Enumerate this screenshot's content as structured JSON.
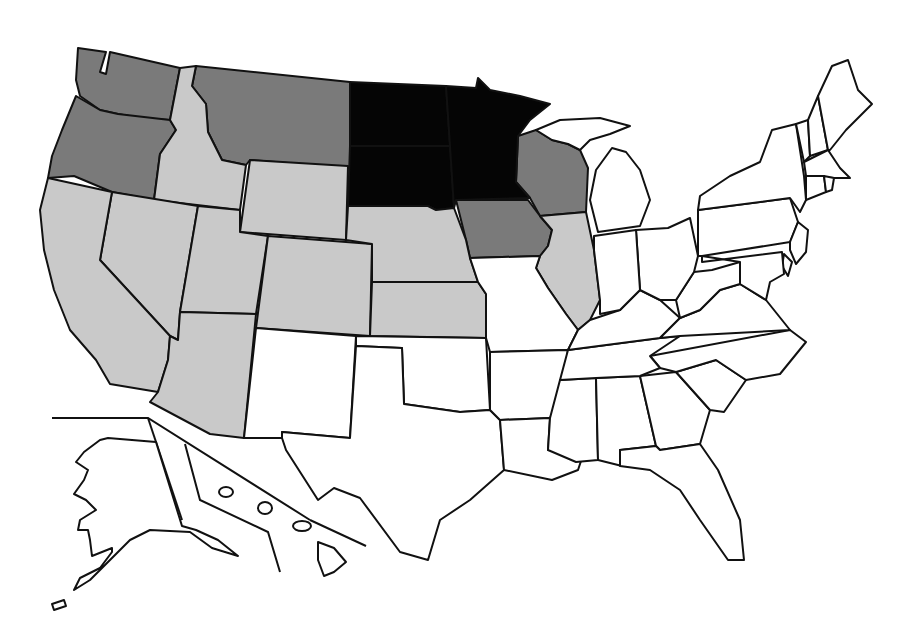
{
  "map": {
    "title": "",
    "legend": [],
    "shading": {
      "black": "#050505",
      "dark_gray": "#7a7a7a",
      "light_gray": "#c9c9c9",
      "white": "#ffffff"
    },
    "states_by_shade": {
      "black": [
        "North Dakota",
        "South Dakota",
        "Minnesota"
      ],
      "dark_gray": [
        "Washington",
        "Oregon",
        "Montana",
        "Wisconsin",
        "Iowa"
      ],
      "light_gray": [
        "Idaho",
        "Wyoming",
        "Nevada",
        "California",
        "Utah",
        "Colorado",
        "Arizona",
        "Nebraska",
        "Kansas",
        "Illinois"
      ],
      "white": [
        "New Mexico",
        "Texas",
        "Oklahoma",
        "Missouri",
        "Arkansas",
        "Louisiana",
        "Mississippi",
        "Alabama",
        "Georgia",
        "Florida",
        "South Carolina",
        "North Carolina",
        "Tennessee",
        "Kentucky",
        "Virginia",
        "West Virginia",
        "Ohio",
        "Indiana",
        "Michigan",
        "Pennsylvania",
        "New York",
        "New Jersey",
        "Delaware",
        "Maryland",
        "Connecticut",
        "Rhode Island",
        "Massachusetts",
        "Vermont",
        "New Hampshire",
        "Maine",
        "Alaska",
        "Hawaii"
      ]
    }
  }
}
